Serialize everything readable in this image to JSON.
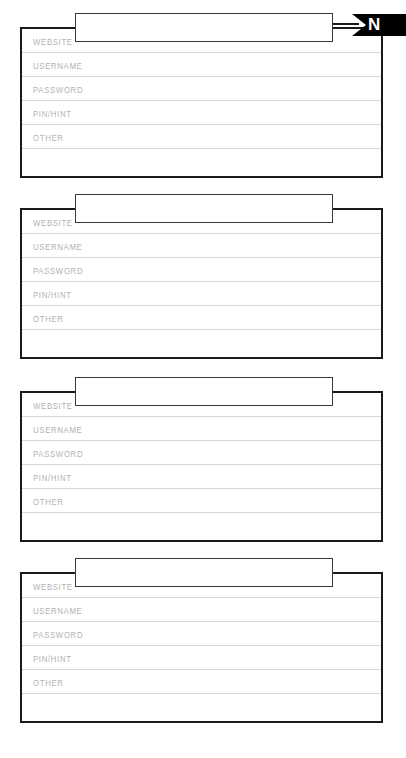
{
  "page": {
    "document_type": "password-log-sheet",
    "background_color": "#ffffff",
    "width": 406,
    "height": 758
  },
  "index_tab": {
    "letter": "N",
    "background_color": "#000000",
    "text_color": "#ffffff"
  },
  "field_labels": {
    "website": "WEBSITE",
    "username": "USERNAME",
    "password": "PASSWORD",
    "pin_hint": "PIN/HINT",
    "other": "OTHER",
    "blank": ""
  },
  "styles": {
    "label_color": "#b2b2b2",
    "rule_color": "#d8d8d8",
    "border_color": "#1a1a1a",
    "title_border_color": "#3a3a3a"
  },
  "entries": [
    {
      "title_placeholder": "",
      "title_value": "",
      "rows": [
        {
          "label": "WEBSITE",
          "value": ""
        },
        {
          "label": "USERNAME",
          "value": ""
        },
        {
          "label": "PASSWORD",
          "value": ""
        },
        {
          "label": "PIN/HINT",
          "value": ""
        },
        {
          "label": "OTHER",
          "value": ""
        },
        {
          "label": "",
          "value": ""
        }
      ]
    },
    {
      "title_placeholder": "",
      "title_value": "",
      "rows": [
        {
          "label": "WEBSITE",
          "value": ""
        },
        {
          "label": "USERNAME",
          "value": ""
        },
        {
          "label": "PASSWORD",
          "value": ""
        },
        {
          "label": "PIN/HINT",
          "value": ""
        },
        {
          "label": "OTHER",
          "value": ""
        },
        {
          "label": "",
          "value": ""
        }
      ]
    },
    {
      "title_placeholder": "",
      "title_value": "",
      "rows": [
        {
          "label": "WEBSITE",
          "value": ""
        },
        {
          "label": "USERNAME",
          "value": ""
        },
        {
          "label": "PASSWORD",
          "value": ""
        },
        {
          "label": "PIN/HINT",
          "value": ""
        },
        {
          "label": "OTHER",
          "value": ""
        },
        {
          "label": "",
          "value": ""
        }
      ]
    },
    {
      "title_placeholder": "",
      "title_value": "",
      "rows": [
        {
          "label": "WEBSITE",
          "value": ""
        },
        {
          "label": "USERNAME",
          "value": ""
        },
        {
          "label": "PASSWORD",
          "value": ""
        },
        {
          "label": "PIN/HINT",
          "value": ""
        },
        {
          "label": "OTHER",
          "value": ""
        },
        {
          "label": "",
          "value": ""
        }
      ]
    }
  ],
  "layout": {
    "card_tops": [
      27,
      208,
      391,
      572
    ],
    "card_height": 151,
    "title_box_tops": [
      13,
      194,
      377,
      558
    ]
  }
}
